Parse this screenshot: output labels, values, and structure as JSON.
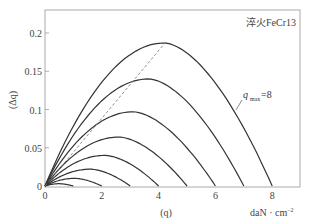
{
  "chart_data": {
    "type": "line",
    "title": "淬火FeCr13",
    "xlabel": "(q)",
    "xunit": "daN · cm⁻²",
    "ylabel": "(Δq)",
    "xlim": [
      0,
      9
    ],
    "ylim": [
      0,
      0.23
    ],
    "xticks": [
      "0",
      "2",
      "4",
      "6",
      "8"
    ],
    "yticks": [
      "0",
      "0.05",
      "0.1",
      "0.15",
      "0.2"
    ],
    "grid": false,
    "annotation": {
      "text": "q",
      "sub": "max",
      "value": "=8"
    },
    "series": [
      {
        "name": "q_max=1",
        "q_max": 1,
        "peak_q": 0.5,
        "peak_dq": 0.003
      },
      {
        "name": "q_max=2",
        "q_max": 2,
        "peak_q": 1.05,
        "peak_dq": 0.01
      },
      {
        "name": "q_max=3",
        "q_max": 3,
        "peak_q": 1.6,
        "peak_dq": 0.022
      },
      {
        "name": "q_max=4",
        "q_max": 4,
        "peak_q": 2.1,
        "peak_dq": 0.04
      },
      {
        "name": "q_max=5",
        "q_max": 5,
        "peak_q": 2.6,
        "peak_dq": 0.064
      },
      {
        "name": "q_max=6",
        "q_max": 6,
        "peak_q": 3.1,
        "peak_dq": 0.097
      },
      {
        "name": "q_max=7",
        "q_max": 7,
        "peak_q": 3.65,
        "peak_dq": 0.14
      },
      {
        "name": "q_max=8",
        "q_max": 8,
        "peak_q": 4.2,
        "peak_dq": 0.187
      }
    ],
    "dashed_line": {
      "name": "peak locus",
      "points": [
        [
          0,
          0
        ],
        [
          4.25,
          0.188
        ]
      ]
    }
  },
  "labels": {
    "title": "淬火FeCr13",
    "xlabel": "(q)",
    "xunit": "daN · cm",
    "xunit_exp": "−2",
    "ylabel": "(Δq)",
    "ann_q": "q",
    "ann_sub": "max",
    "ann_val": "=8"
  }
}
